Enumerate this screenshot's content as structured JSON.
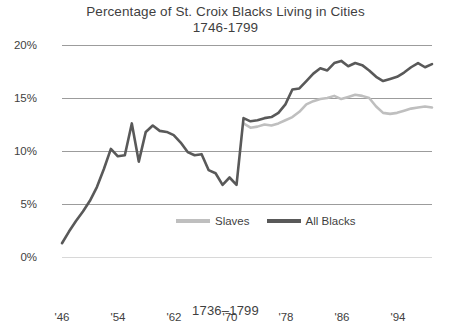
{
  "chart_data": {
    "type": "line",
    "title": "Percentage of St. Croix Blacks Living in Cities",
    "subtitle": "1746-1799",
    "caption": "1736–1799",
    "xlabel": "",
    "ylabel": "",
    "ylim": [
      0,
      20
    ],
    "xlim": [
      1746,
      1799
    ],
    "grid": true,
    "legend_position": "inside-bottom-center",
    "ytick_labels": [
      "0%",
      "5%",
      "10%",
      "15%",
      "20%"
    ],
    "ytick_values": [
      0,
      5,
      10,
      15,
      20
    ],
    "xtick_labels": [
      "'46",
      "'54",
      "'62",
      "'70",
      "'78",
      "'86",
      "'94"
    ],
    "xtick_values": [
      1746,
      1754,
      1762,
      1770,
      1778,
      1786,
      1794
    ],
    "colors": {
      "slaves": "#bfbfbf",
      "all_blacks": "#595959",
      "gridline": "#9c9c9c",
      "text": "#3f3f3f"
    },
    "series": [
      {
        "name": "Slaves",
        "color": "#bfbfbf",
        "x": [
          1772,
          1773,
          1774,
          1775,
          1776,
          1777,
          1778,
          1779,
          1780,
          1781,
          1782,
          1783,
          1784,
          1785,
          1786,
          1787,
          1788,
          1789,
          1790,
          1791,
          1792,
          1793,
          1794,
          1795,
          1796,
          1797,
          1798,
          1799
        ],
        "values": [
          12.6,
          12.2,
          12.3,
          12.5,
          12.4,
          12.6,
          12.9,
          13.2,
          13.7,
          14.4,
          14.7,
          14.9,
          15.0,
          15.2,
          14.9,
          15.1,
          15.3,
          15.2,
          15.0,
          14.2,
          13.6,
          13.5,
          13.6,
          13.8,
          14.0,
          14.1,
          14.2,
          14.1
        ]
      },
      {
        "name": "All Blacks",
        "color": "#595959",
        "x": [
          1746,
          1747,
          1748,
          1749,
          1750,
          1751,
          1752,
          1753,
          1754,
          1755,
          1756,
          1757,
          1758,
          1759,
          1760,
          1761,
          1762,
          1763,
          1764,
          1765,
          1766,
          1767,
          1768,
          1769,
          1770,
          1771,
          1772,
          1773,
          1774,
          1775,
          1776,
          1777,
          1778,
          1779,
          1780,
          1781,
          1782,
          1783,
          1784,
          1785,
          1786,
          1787,
          1788,
          1789,
          1790,
          1791,
          1792,
          1793,
          1794,
          1795,
          1796,
          1797,
          1798,
          1799
        ],
        "values": [
          1.3,
          2.4,
          3.4,
          4.3,
          5.3,
          6.6,
          8.3,
          10.2,
          9.5,
          9.6,
          12.6,
          9.0,
          11.8,
          12.4,
          11.9,
          11.8,
          11.5,
          10.8,
          9.9,
          9.6,
          9.7,
          8.2,
          7.9,
          6.8,
          7.5,
          6.8,
          13.1,
          12.8,
          12.9,
          13.1,
          13.2,
          13.6,
          14.4,
          15.8,
          15.9,
          16.6,
          17.3,
          17.8,
          17.6,
          18.3,
          18.5,
          18.0,
          18.3,
          18.1,
          17.6,
          17.0,
          16.6,
          16.8,
          17.0,
          17.4,
          17.9,
          18.3,
          17.9,
          18.2
        ]
      }
    ]
  },
  "legend": {
    "items": [
      {
        "label": "Slaves",
        "color": "#bfbfbf"
      },
      {
        "label": "All Blacks",
        "color": "#595959"
      }
    ]
  }
}
